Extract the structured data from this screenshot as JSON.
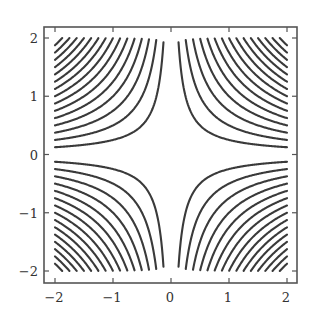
{
  "chart_data": {
    "type": "contour",
    "title": "",
    "xlabel": "",
    "ylabel": "",
    "function": "f(x, y) = x * y",
    "xlim": [
      -2.2,
      2.2
    ],
    "ylim": [
      -2.2,
      2.2
    ],
    "data_range": {
      "x": [
        -2,
        2
      ],
      "y": [
        -2,
        2
      ]
    },
    "x_ticks": [
      -2,
      -1,
      0,
      1,
      2
    ],
    "y_ticks": [
      -2,
      -1,
      0,
      1,
      2
    ],
    "x_tick_labels": [
      "−2",
      "−1",
      "0",
      "1",
      "2"
    ],
    "y_tick_labels": [
      "−2",
      "−1",
      "0",
      "1",
      "2"
    ],
    "levels": [
      -4,
      -3.75,
      -3.5,
      -3.25,
      -3,
      -2.75,
      -2.5,
      -2.25,
      -2,
      -1.75,
      -1.5,
      -1.25,
      -1,
      -0.75,
      -0.5,
      -0.25,
      0.25,
      0.5,
      0.75,
      1,
      1.25,
      1.5,
      1.75,
      2,
      2.25,
      2.5,
      2.75,
      3,
      3.25,
      3.5,
      3.75,
      4
    ],
    "level_step": 0.25,
    "grid": false,
    "legend": null,
    "line_color": "#3a3a3a",
    "frame_color": "#555555"
  }
}
